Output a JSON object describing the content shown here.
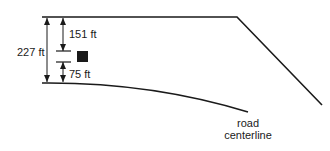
{
  "diagram": {
    "labels": {
      "total_distance": "227 ft",
      "upper_distance": "151 ft",
      "lower_distance": "75 ft",
      "road_line1": "road",
      "road_line2": "centerline"
    },
    "colors": {
      "line": "#1a1a1a",
      "marker": "#1a1a1a",
      "background": "#ffffff"
    },
    "elements": [
      "upper-boundary-line",
      "road-centerline-curve",
      "total-dimension-arrow",
      "upper-dimension-arrow",
      "lower-dimension-arrow",
      "site-marker-square"
    ]
  }
}
